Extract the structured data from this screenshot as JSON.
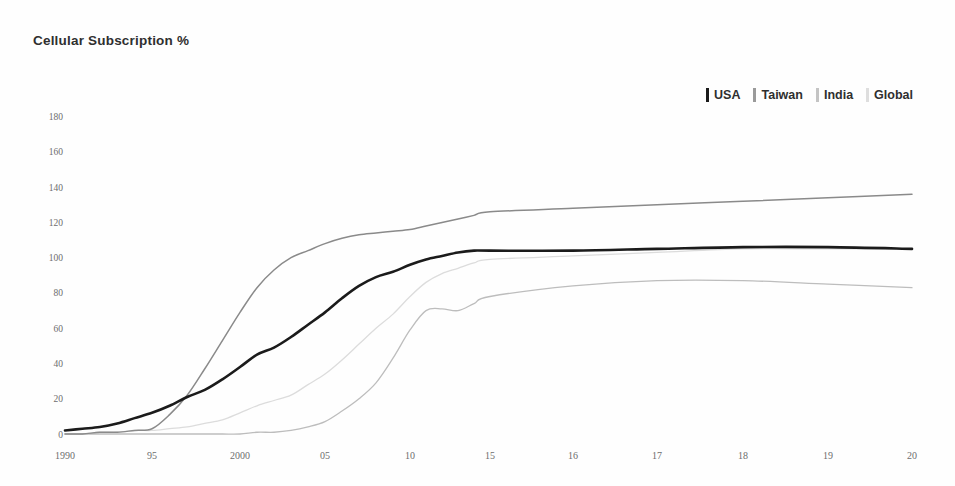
{
  "chart_data": {
    "type": "line",
    "title": "Cellular Subscription %",
    "xlabel": "",
    "ylabel": "",
    "ylim": [
      0,
      190
    ],
    "xlim": [
      1990,
      2020
    ],
    "grid": false,
    "legend_position": "top-right",
    "y_ticks": [
      0,
      20,
      40,
      60,
      80,
      100,
      120,
      140,
      160,
      180
    ],
    "x_ticks": [
      {
        "value": 1990,
        "label": "1990"
      },
      {
        "value": 1995,
        "label": "95"
      },
      {
        "value": 2000,
        "label": "2000"
      },
      {
        "value": 2005,
        "label": "05"
      },
      {
        "value": 2010,
        "label": "10"
      },
      {
        "value": 2015,
        "label": "15"
      },
      {
        "value": 2016,
        "label": "16"
      },
      {
        "value": 2017,
        "label": "17"
      },
      {
        "value": 2018,
        "label": "18"
      },
      {
        "value": 2019,
        "label": "19"
      },
      {
        "value": 2020,
        "label": "20"
      }
    ],
    "x": [
      1990,
      1991,
      1992,
      1993,
      1994,
      1995,
      1996,
      1997,
      1998,
      1999,
      2000,
      2001,
      2002,
      2003,
      2004,
      2005,
      2006,
      2007,
      2008,
      2009,
      2010,
      2011,
      2012,
      2013,
      2014,
      2015,
      2016,
      2017,
      2018,
      2019,
      2020
    ],
    "series": [
      {
        "name": "USA",
        "color": "#1b1b1b",
        "width": 2.6,
        "dash": "none",
        "values": [
          2,
          3,
          4,
          6,
          9,
          12,
          16,
          21,
          25,
          31,
          38,
          45,
          49,
          55,
          62,
          69,
          77,
          84,
          89,
          92,
          96,
          99,
          101,
          103,
          104,
          104,
          104,
          105,
          106,
          106,
          105
        ]
      },
      {
        "name": "Taiwan",
        "color": "#8a8a8a",
        "width": 1.5,
        "dash": "none",
        "values": [
          0,
          0,
          1,
          1,
          2,
          3,
          11,
          22,
          37,
          53,
          69,
          83,
          93,
          100,
          104,
          108,
          111,
          113,
          114,
          115,
          116,
          118,
          120,
          122,
          124,
          126,
          128,
          130,
          132,
          134,
          136
        ]
      },
      {
        "name": "India",
        "color": "#bdbdbd",
        "width": 1.3,
        "dash": "none",
        "values": [
          0,
          0,
          0,
          0,
          0,
          0,
          0,
          0,
          0,
          0,
          0,
          1,
          1,
          2,
          4,
          7,
          13,
          20,
          29,
          43,
          59,
          70,
          71,
          70,
          74,
          78,
          84,
          87,
          87,
          85,
          83
        ]
      },
      {
        "name": "Global",
        "color": "#dcdcdc",
        "width": 1.3,
        "dash": "none",
        "values": [
          0,
          0,
          1,
          1,
          2,
          2,
          3,
          4,
          6,
          8,
          12,
          16,
          19,
          22,
          28,
          34,
          42,
          51,
          60,
          68,
          78,
          86,
          91,
          94,
          97,
          99,
          101,
          103,
          105,
          105,
          105
        ]
      }
    ]
  },
  "legend": {
    "items": [
      {
        "label": "USA",
        "color": "#1b1b1b"
      },
      {
        "label": "Taiwan",
        "color": "#9a9a9a"
      },
      {
        "label": "India",
        "color": "#c4c4c4"
      },
      {
        "label": "Global",
        "color": "#dedede"
      }
    ]
  }
}
